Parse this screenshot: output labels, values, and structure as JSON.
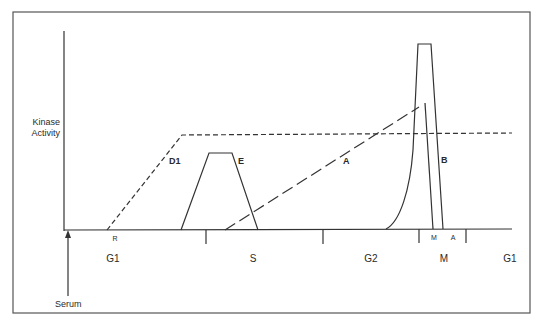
{
  "diagram": {
    "y_axis_label": [
      "Kinase",
      "Activity"
    ],
    "stimulus_label": "Serum",
    "curves": [
      {
        "id": "D1",
        "label": "D1",
        "style": "short-dash"
      },
      {
        "id": "E",
        "label": "E",
        "style": "solid"
      },
      {
        "id": "A",
        "label": "A",
        "style": "long-dash"
      },
      {
        "id": "B",
        "label": "B",
        "style": "solid"
      }
    ],
    "phase_labels": [
      "G1",
      "S",
      "G2",
      "M",
      "G1"
    ],
    "sub_labels": {
      "restriction_point": "R",
      "mitosis": "M",
      "anaphase": "A"
    },
    "colors": {
      "line": "#333333",
      "frame": "#555555",
      "background": "#ffffff"
    }
  }
}
